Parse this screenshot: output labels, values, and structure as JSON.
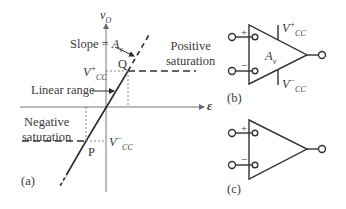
{
  "panel_a": {
    "y_axis_label": "v",
    "y_axis_sub": "O",
    "x_axis_label": "ε",
    "slope_label": "Slope = ",
    "slope_symbol": "A",
    "slope_sub": "v",
    "positive_saturation_line1": "Positive",
    "positive_saturation_line2": "saturation",
    "negative_saturation_line1": "Negative",
    "negative_saturation_line2": "saturation",
    "linear_range_label": "Linear range",
    "vcc_plus": "V",
    "vcc_plus_sup": "+",
    "vcc_plus_sub": "CC",
    "vcc_minus": "V",
    "vcc_minus_sup": "−",
    "vcc_minus_sub": "CC",
    "point_q": "Q",
    "point_p": "P",
    "panel_label": "(a)"
  },
  "panel_b": {
    "plus_sign": "+",
    "minus_sign": "−",
    "gain_symbol": "A",
    "gain_sub": "v",
    "vcc_plus": "V",
    "vcc_plus_sup": "+",
    "vcc_plus_sub": "CC",
    "vcc_minus": "V",
    "vcc_minus_sup": "−",
    "vcc_minus_sub": "CC",
    "panel_label": "(b)"
  },
  "panel_c": {
    "plus_sign": "+",
    "minus_sign": "−",
    "panel_label": "(c)"
  },
  "colors": {
    "line": "#2b2b2b",
    "axis": "#6a6a6a",
    "text": "#3a3a3a"
  }
}
